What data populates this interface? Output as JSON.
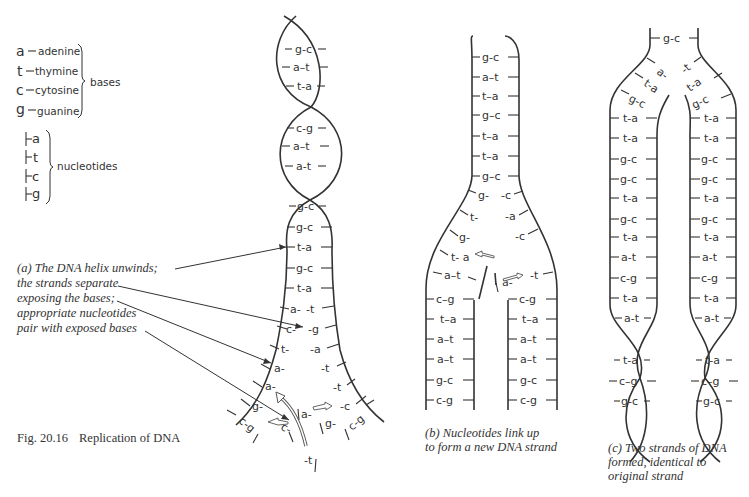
{
  "legend": {
    "bases": [
      {
        "symbol": "a",
        "name": "adenine"
      },
      {
        "symbol": "t",
        "name": "thymine"
      },
      {
        "symbol": "c",
        "name": "cytosine"
      },
      {
        "symbol": "g",
        "name": "guanine"
      }
    ],
    "bases_label": "bases",
    "nucleotides": [
      "a",
      "t",
      "c",
      "g"
    ],
    "nucleotides_label": "nucleotides"
  },
  "panel_a": {
    "caption_lines": [
      "(a) The DNA helix unwinds;",
      "the strands separate",
      "exposing the bases;",
      "appropriate nucleotides",
      "pair with exposed bases"
    ],
    "helix_pairs": [
      "g-c",
      "a–t",
      "t-a",
      "c-g",
      "a–t",
      "a-t",
      "g-c"
    ],
    "ladder_pairs": [
      "g-c",
      "t-a",
      "g-c",
      "t-a"
    ],
    "separating_left": [
      "a-",
      "c-",
      "t-",
      "a-",
      "a-",
      "g-"
    ],
    "separating_right": [
      "-t",
      "-g",
      "-a",
      "-t",
      "-t",
      "-c"
    ],
    "free_nucleotides": [
      "c-",
      "a-",
      "g-",
      "-t"
    ],
    "end_pairs": [
      "c-g",
      "c-g"
    ]
  },
  "panel_b": {
    "caption_lines": [
      "(b) Nucleotides link up",
      "to form a new DNA strand"
    ],
    "top_pairs": [
      "g-c",
      "a–t",
      "t–a",
      "g–c",
      "t–a",
      "t–a",
      "g–c"
    ],
    "fork_left": [
      "g-",
      "t-",
      "g-"
    ],
    "fork_right": [
      "-c",
      "-a",
      "-c"
    ],
    "left_arm": [
      "t-  a",
      "a–t",
      "c–g",
      "t–a",
      "a–t",
      "a–t",
      "g-c",
      "c-g"
    ],
    "right_arm": [
      "a-",
      "-t",
      "c-g",
      "t–a",
      "a–t",
      "a–t",
      "g-c",
      "c-g"
    ]
  },
  "panel_c": {
    "caption_lines": [
      "(c) Two strands of DNA",
      "formed, identical to",
      "original strand"
    ],
    "top_pair": "g-c",
    "fork_left": [
      "a-",
      "t-a",
      "g-c"
    ],
    "fork_right": [
      "-t",
      "t-a",
      "g-c"
    ],
    "strand_pairs": [
      "t-a",
      "t-a",
      "g-c",
      "g-c",
      "t-a",
      "g-c",
      "t-a",
      "a-t",
      "c-g",
      "t-a",
      "a-t"
    ],
    "helix_pairs": [
      "t-a",
      "c–g",
      "g-c"
    ]
  },
  "figure_caption": {
    "number": "Fig. 20.16",
    "title": "Replication of DNA"
  }
}
